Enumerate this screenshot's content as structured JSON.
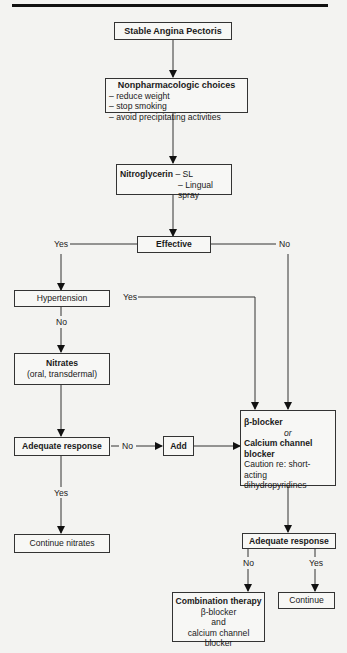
{
  "nodes": {
    "stable_angina": {
      "title": "Stable Angina Pectoris"
    },
    "nonpharm": {
      "title": "Nonpharmacologic choices",
      "items": [
        "– reduce weight",
        "– stop smoking",
        "– avoid precipitating activities"
      ]
    },
    "nitroglycerin": {
      "title": "Nitroglycerin",
      "line1": " – SL",
      "line2": "– Lingual spray"
    },
    "effective": {
      "title": "Effective"
    },
    "hypertension": {
      "title": "Hypertension"
    },
    "nitrates": {
      "title": "Nitrates",
      "subtitle": "(oral, transdermal)"
    },
    "adequate_response_left": {
      "title": "Adequate response"
    },
    "add": {
      "title": "Add"
    },
    "beta_ccb": {
      "line1": "β-blocker",
      "line2": "or",
      "line3": "Calcium channel",
      "line4": "blocker",
      "line5": "Caution re: short-acting",
      "line6": "dihydropyridines"
    },
    "continue_nitrates": {
      "title": "Continue nitrates"
    },
    "adequate_response_right": {
      "title": "Adequate response"
    },
    "combination": {
      "title": "Combination therapy",
      "line1": "β-blocker",
      "line2": "and",
      "line3": "calcium channel blocker"
    },
    "continue": {
      "title": "Continue"
    }
  },
  "edge_labels": {
    "effective_yes": "Yes",
    "effective_no": "No",
    "hypertension_yes": "Yes",
    "hypertension_no": "No",
    "adequate_left_no": "No",
    "adequate_left_yes": "Yes",
    "adequate_right_no": "No",
    "adequate_right_yes": "Yes"
  }
}
